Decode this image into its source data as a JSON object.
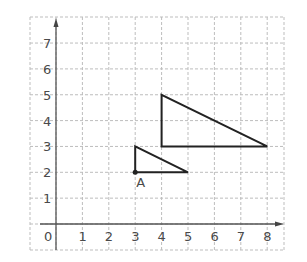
{
  "diagram": {
    "type": "coordinate-grid",
    "x_axis": {
      "min": 0,
      "max": 8,
      "tick_labels": [
        "0",
        "1",
        "2",
        "3",
        "4",
        "5",
        "6",
        "7",
        "8"
      ]
    },
    "y_axis": {
      "min": 0,
      "max": 7,
      "tick_labels": [
        "1",
        "2",
        "3",
        "4",
        "5",
        "6",
        "7"
      ]
    },
    "origin_label": "0",
    "shapes": [
      {
        "name": "small-triangle",
        "vertices": [
          [
            3,
            2
          ],
          [
            3,
            3
          ],
          [
            5,
            2
          ]
        ]
      },
      {
        "name": "large-triangle",
        "vertices": [
          [
            4,
            3
          ],
          [
            4,
            5
          ],
          [
            8,
            3
          ]
        ]
      }
    ],
    "points": [
      {
        "label": "A",
        "x": 3,
        "y": 2
      }
    ],
    "colors": {
      "grid": "#bdbdbd",
      "axis": "#555555",
      "shape": "#222222",
      "text": "#4a4a4a"
    }
  }
}
